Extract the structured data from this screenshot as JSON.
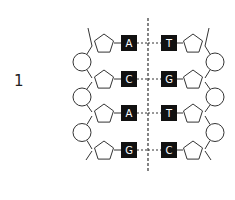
{
  "diagram": {
    "label": "1",
    "left_strand": [
      "A",
      "C",
      "A",
      "G"
    ],
    "right_strand": [
      "T",
      "G",
      "T",
      "C"
    ],
    "colors": {
      "base_box": "#111111",
      "line": "#333333",
      "base_text": "#ffffff"
    }
  }
}
